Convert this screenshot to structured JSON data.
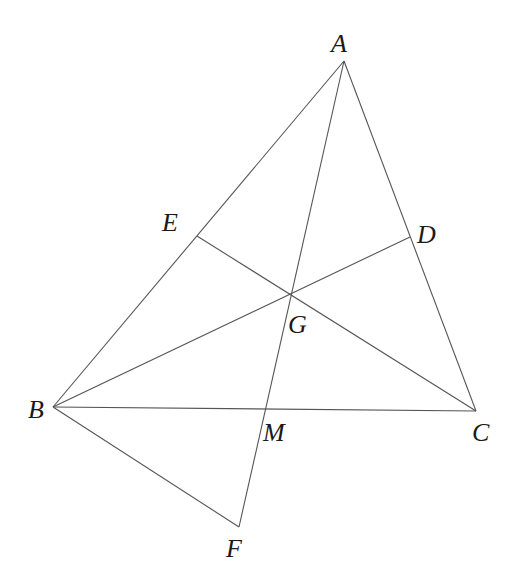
{
  "diagram": {
    "type": "geometry",
    "points": {
      "A": {
        "label": "A",
        "x": 344,
        "y": 61,
        "lx": 331,
        "ly": 52
      },
      "B": {
        "label": "B",
        "x": 53,
        "y": 407,
        "lx": 28,
        "ly": 418
      },
      "C": {
        "label": "C",
        "x": 476,
        "y": 411,
        "lx": 472,
        "ly": 441
      },
      "D": {
        "label": "D",
        "x": 410,
        "y": 237,
        "lx": 417,
        "ly": 243
      },
      "E": {
        "label": "E",
        "x": 197,
        "y": 236,
        "lx": 162,
        "ly": 231
      },
      "G": {
        "label": "G",
        "x": 291,
        "y": 294,
        "lx": 288,
        "ly": 333
      },
      "M": {
        "label": "M",
        "x": 265,
        "y": 409,
        "lx": 263,
        "ly": 441
      },
      "F": {
        "label": "F",
        "x": 239,
        "y": 527,
        "lx": 226,
        "ly": 557
      }
    },
    "segments": [
      [
        "A",
        "B"
      ],
      [
        "A",
        "C"
      ],
      [
        "B",
        "C"
      ],
      [
        "A",
        "F"
      ],
      [
        "B",
        "D"
      ],
      [
        "C",
        "E"
      ],
      [
        "B",
        "F"
      ]
    ]
  }
}
